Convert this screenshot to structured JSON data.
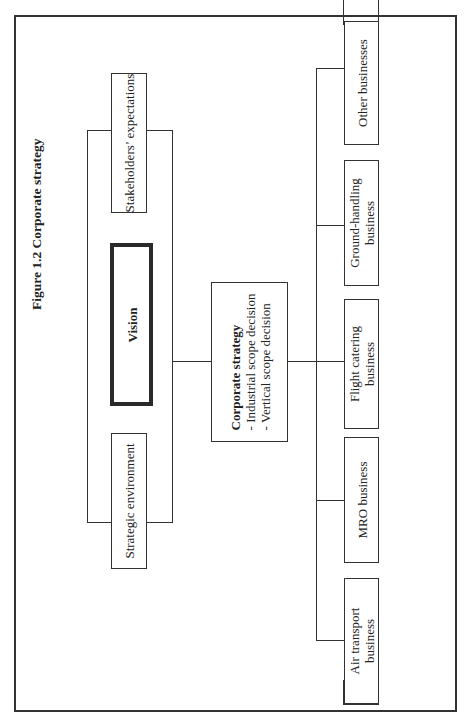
{
  "figure": {
    "title": "Figure 1.2 Corporate strategy"
  },
  "inputs": {
    "stakeholders": "Stakeholders’ expectations",
    "vision": "Vision",
    "strategic_environment": "Strategic environment"
  },
  "corporate_strategy": {
    "heading": "Corporate strategy",
    "items": [
      "- Industrial scope decision",
      "- Vertical scope decision"
    ]
  },
  "businesses": [
    {
      "line1": "Other businesses",
      "line2": ""
    },
    {
      "line1": "Ground-handling",
      "line2": "business"
    },
    {
      "line1": "Flight catering",
      "line2": "business"
    },
    {
      "line1": "MRO business",
      "line2": ""
    },
    {
      "line1": "Air transport",
      "line2": "business"
    }
  ]
}
